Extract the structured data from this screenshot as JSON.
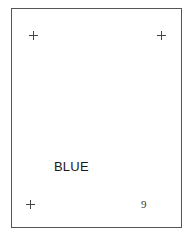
{
  "card": {
    "word": "BLUE",
    "number": "9",
    "markers": [
      {
        "name": "top-left",
        "icon": "plus-icon"
      },
      {
        "name": "top-right",
        "icon": "plus-icon"
      },
      {
        "name": "bottom-left",
        "icon": "plus-icon"
      }
    ],
    "colors": {
      "border": "#555555",
      "text": "#1a1a1a",
      "background": "#ffffff"
    }
  }
}
